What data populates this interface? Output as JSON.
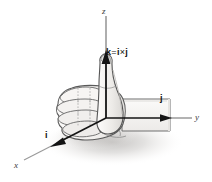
{
  "figure": {
    "background_color": "#ffffff",
    "width": 212,
    "height": 182
  },
  "axes": {
    "z": {
      "label": "z",
      "description": "vertical axis pointing up through thumb"
    },
    "y": {
      "label": "y",
      "description": "horizontal axis pointing right along forearm"
    },
    "x": {
      "label": "x",
      "description": "oblique axis pointing down-left toward viewer"
    }
  },
  "vectors": {
    "i": {
      "label": "i",
      "bold": true,
      "direction": "down-left along x axis"
    },
    "j": {
      "label": "j",
      "bold": true,
      "direction": "right along y axis"
    },
    "k": {
      "label": "k",
      "bold": true,
      "direction": "up along z axis, thumb"
    }
  },
  "equation": {
    "lhs": "k",
    "operator_equals": "=",
    "rhs_first": "i",
    "operator_cross": "×",
    "rhs_second": "j",
    "full_text": "k = i × j"
  },
  "illustration": {
    "subject": "right hand closed in a fist with thumb extended upward",
    "parts": [
      "fist",
      "curled-fingers",
      "thumb",
      "forearm",
      "shadow"
    ],
    "line_color": "#4a4a4a",
    "fill_color": "#f2f0ee",
    "arrow_color": "#1a1a1a",
    "axis_color": "#8e8e8e"
  },
  "colors": {
    "axis_gray": "#8e8e8e",
    "arrow_black": "#141414",
    "hand_outline": "#555555",
    "hand_fill": "#f4f2f0",
    "shadow": "#c9c7c5",
    "text": "#1a1a1a"
  }
}
